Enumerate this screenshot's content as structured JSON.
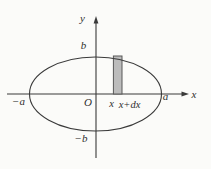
{
  "labels": {
    "y_axis": "y",
    "x_axis": "x",
    "origin": "O",
    "b_top": "b",
    "b_bottom": "−b",
    "a_left": "−a",
    "a_right": "a",
    "strip_x": "x",
    "strip_x_dx": "x+dx"
  },
  "colors": {
    "background": "#fbfbf9",
    "line": "#3a3a3a",
    "strip_fill": "#bcbcbc",
    "strip_stroke": "#585858"
  }
}
